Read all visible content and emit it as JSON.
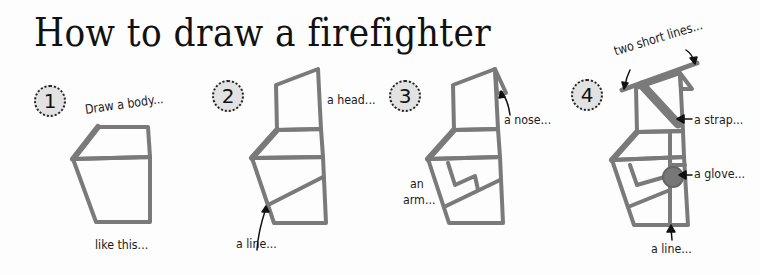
{
  "title": "How to draw a firefighter",
  "steps": [
    {
      "number": "1",
      "labels": {
        "top": "Draw a body...",
        "bottom": "like this..."
      }
    },
    {
      "number": "2",
      "labels": {
        "head": "a head...",
        "line": "a line..."
      }
    },
    {
      "number": "3",
      "labels": {
        "nose": "a nose...",
        "arm_1": "an",
        "arm_2": "arm..."
      }
    },
    {
      "number": "4",
      "labels": {
        "short_lines": "two short lines...",
        "strap": "a strap...",
        "glove": "a glove...",
        "line": "a line..."
      }
    }
  ],
  "colors": {
    "stroke": "#7a7a7a",
    "text": "#1a1a1a",
    "badge": "#e2e2e2",
    "background": "#fdfdfd"
  }
}
